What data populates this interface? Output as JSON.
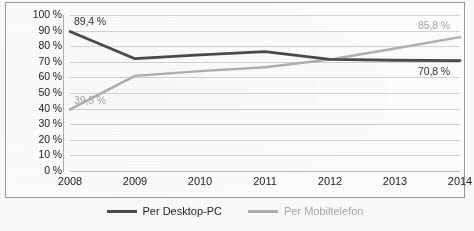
{
  "chart_data": {
    "type": "line",
    "title": "",
    "subtitle": "",
    "xlabel": "",
    "ylabel": "",
    "categories": [
      "2008",
      "2009",
      "2010",
      "2011",
      "2012",
      "2013",
      "2014"
    ],
    "ylim": [
      0,
      100
    ],
    "yticks": [
      "0 %",
      "10 %",
      "20 %",
      "30 %",
      "40 %",
      "50 %",
      "60 %",
      "70 %",
      "80 %",
      "90 %",
      "100 %"
    ],
    "ytick_values": [
      0,
      10,
      20,
      30,
      40,
      50,
      60,
      70,
      80,
      90,
      100
    ],
    "grid": true,
    "legend_position": "bottom",
    "value_suffix": " %",
    "decimal_separator": ",",
    "series": [
      {
        "name": "Per Desktop-PC",
        "color": "#4a4a4a",
        "values": [
          89.4,
          72.0,
          74.5,
          76.5,
          71.5,
          71.0,
          70.8
        ],
        "labels": [
          {
            "index": 0,
            "text": "89,4 %"
          },
          {
            "index": 6,
            "text": "70,8 %"
          }
        ]
      },
      {
        "name": "Per Mobiltelefon",
        "color": "#b0b0b0",
        "values": [
          39.5,
          61.0,
          64.0,
          66.5,
          71.5,
          78.5,
          85.8
        ],
        "labels": [
          {
            "index": 0,
            "text": "39,5 %"
          },
          {
            "index": 6,
            "text": "85,8 %"
          }
        ]
      }
    ],
    "annotations": [
      {
        "name": "label-desktop-2008",
        "text": "89,4 %"
      },
      {
        "name": "label-mobile-2008",
        "text": "39,5 %"
      },
      {
        "name": "label-mobile-2014",
        "text": "85,8 %"
      },
      {
        "name": "label-desktop-2014",
        "text": "70,8 %"
      }
    ]
  }
}
